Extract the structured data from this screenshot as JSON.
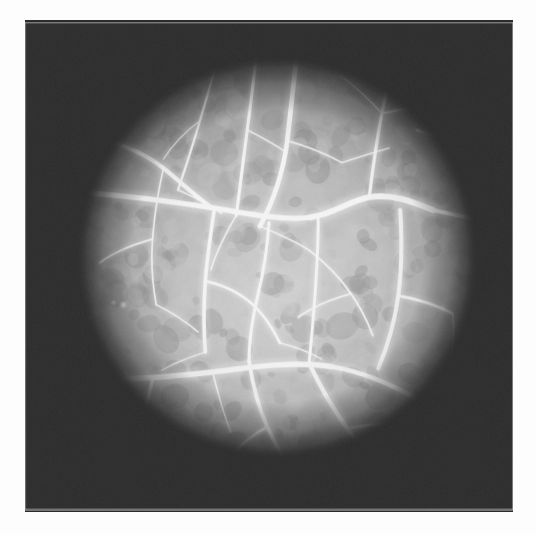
{
  "document": {
    "kind": "photograph",
    "modality": "fluorescein-angiogram",
    "subject": "retinal-fundus",
    "caption": "",
    "page_background": "#fdfdfd"
  },
  "canvas": {
    "width": 536,
    "height": 535
  },
  "photo": {
    "x": 25,
    "y": 20,
    "width": 488,
    "height": 492,
    "border_color": "#d8d8d8",
    "vignette_color": "#2b2b2b",
    "mid_tone": "#8d8d8d",
    "bright_tone": "#e2e2e2",
    "vessel_color": "#f4f4f4"
  },
  "aperture": {
    "label": "circular-fundus-field",
    "cx": 277,
    "cy": 258,
    "r": 222,
    "falloff_inner_pct": 52,
    "falloff_outer_pct": 100
  },
  "chart_data": {
    "type": "scatter",
    "xlabel": "",
    "ylabel": "",
    "categories": [
      "choroidal-background",
      "arterioles",
      "venules",
      "capillary-network"
    ],
    "values": [
      1,
      1,
      1,
      1
    ],
    "grid": false,
    "legend": "none"
  },
  "features": {
    "background_mottle": {
      "name": "choroidal-mottling",
      "blob_count": 420,
      "dark_value": "#6e6e6e",
      "light_value": "#cfcfcf"
    },
    "vessels": [
      {
        "name": "superior-temporal-arcade",
        "width": 5.2,
        "path": "M 300 22 C 296 60, 292 96, 288 130 C 283 168, 272 198, 258 224"
      },
      {
        "name": "superior-nasal-branch",
        "width": 3.4,
        "path": "M 255 25 C 252 58, 248 88, 244 118 C 240 150, 236 182, 232 212"
      },
      {
        "name": "superior-nasal-minor",
        "width": 2.4,
        "path": "M 214 26 C 208 54, 200 82, 192 108 C 184 136, 176 160, 168 184"
      },
      {
        "name": "upper-left-arch",
        "width": 4.6,
        "path": "M 82 128 C 108 134, 132 144, 152 160 C 172 176, 188 192, 206 204"
      },
      {
        "name": "left-horizontal-trunk",
        "width": 5.8,
        "path": "M 58 186 C 108 190, 160 196, 208 204 C 250 211, 286 218, 314 214"
      },
      {
        "name": "central-arch-right",
        "width": 6.4,
        "path": "M 314 214 C 340 210, 356 196, 378 192 C 402 188, 424 196, 448 206"
      },
      {
        "name": "right-upper-diagonal",
        "width": 4.2,
        "path": "M 448 206 C 466 210, 482 214, 500 216"
      },
      {
        "name": "right-superior-branch",
        "width": 3.6,
        "path": "M 378 192 C 382 160, 386 130, 392 100 C 396 76, 402 56, 410 38"
      },
      {
        "name": "right-superior-minor",
        "width": 2.6,
        "path": "M 392 100 C 412 96, 432 92, 452 88 C 468 86, 480 88, 492 92"
      },
      {
        "name": "right-marginal-arc",
        "width": 3.0,
        "path": "M 430 118 C 452 124, 472 134, 490 148"
      },
      {
        "name": "mid-descending-trunk",
        "width": 4.0,
        "path": "M 208 204 C 204 232, 200 258, 198 284 C 196 312, 196 338, 198 362"
      },
      {
        "name": "mid-descending-branch",
        "width": 2.8,
        "path": "M 198 284 C 216 288, 234 296, 248 308 C 262 320, 272 336, 280 352"
      },
      {
        "name": "center-descending-vein",
        "width": 3.4,
        "path": "M 268 220 C 266 248, 262 274, 256 298 C 250 324, 246 348, 246 372"
      },
      {
        "name": "center-right-descending",
        "width": 3.2,
        "path": "M 322 216 C 322 248, 320 278, 318 306 C 316 332, 314 354, 312 374"
      },
      {
        "name": "right-descending-arcade",
        "width": 4.4,
        "path": "M 412 206 C 414 238, 414 270, 410 300 C 406 330, 398 356, 388 380"
      },
      {
        "name": "right-lateral-branch",
        "width": 3.0,
        "path": "M 410 300 C 432 304, 452 310, 470 320"
      },
      {
        "name": "inferior-horizontal-trunk",
        "width": 6.0,
        "path": "M 66 394 C 112 392, 160 390, 206 384 C 252 378, 296 372, 336 378"
      },
      {
        "name": "inferior-right-trunk",
        "width": 5.0,
        "path": "M 336 378 C 372 384, 404 398, 434 416 C 452 428, 466 438, 480 448"
      },
      {
        "name": "inferior-left-descending",
        "width": 3.6,
        "path": "M 140 392 C 134 418, 128 442, 122 464 C 118 480, 114 494, 112 506"
      },
      {
        "name": "lower-left-arc",
        "width": 3.2,
        "path": "M 66 394 C 76 416, 88 436, 104 452 C 120 468, 140 478, 160 484"
      },
      {
        "name": "inferior-mid-descending",
        "width": 4.2,
        "path": "M 246 372 C 250 398, 256 422, 266 444 C 276 466, 288 486, 300 506"
      },
      {
        "name": "inferior-mid-branch",
        "width": 2.8,
        "path": "M 266 444 C 248 454, 232 468, 220 484 C 212 494, 206 502, 202 510"
      },
      {
        "name": "inferior-center-vein",
        "width": 4.8,
        "path": "M 312 374 C 324 400, 338 424, 354 446 C 368 466, 382 484, 396 500"
      },
      {
        "name": "inferior-right-branch",
        "width": 3.0,
        "path": "M 354 446 C 376 442, 398 440, 418 442"
      },
      {
        "name": "capillary-a",
        "width": 1.8,
        "path": "M 152 160 C 146 186, 142 212, 140 238 C 138 264, 140 288, 144 310"
      },
      {
        "name": "capillary-b",
        "width": 1.8,
        "path": "M 140 238 C 118 244, 98 252, 82 264"
      },
      {
        "name": "capillary-c",
        "width": 1.6,
        "path": "M 144 310 C 160 318, 176 328, 190 340"
      },
      {
        "name": "capillary-d",
        "width": 1.6,
        "path": "M 258 224 C 278 232, 296 240, 312 250"
      },
      {
        "name": "capillary-e",
        "width": 1.8,
        "path": "M 312 250 C 330 264, 346 280, 358 298 C 368 312, 376 328, 382 344"
      },
      {
        "name": "capillary-f",
        "width": 1.6,
        "path": "M 358 298 C 336 304, 316 312, 300 324"
      },
      {
        "name": "capillary-g",
        "width": 1.6,
        "path": "M 206 384 C 212 408, 218 430, 226 450"
      },
      {
        "name": "capillary-h",
        "width": 1.5,
        "path": "M 232 212 C 220 232, 210 252, 204 272"
      },
      {
        "name": "capillary-i",
        "width": 1.5,
        "path": "M 288 130 C 310 136, 330 144, 348 154"
      },
      {
        "name": "capillary-j",
        "width": 1.5,
        "path": "M 348 154 C 366 148, 384 142, 400 138"
      },
      {
        "name": "capillary-k",
        "width": 1.4,
        "path": "M 168 184 C 186 192, 202 200, 216 210"
      },
      {
        "name": "capillary-l",
        "width": 1.4,
        "path": "M 452 88 C 458 108, 462 128, 464 148"
      },
      {
        "name": "capillary-m",
        "width": 1.5,
        "path": "M 470 320 C 472 342, 470 362, 464 380"
      },
      {
        "name": "capillary-n",
        "width": 1.4,
        "path": "M 198 362 C 180 368, 164 374, 150 382"
      },
      {
        "name": "capillary-o",
        "width": 1.5,
        "path": "M 280 352 C 296 356, 312 362, 326 370"
      },
      {
        "name": "capillary-p",
        "width": 1.4,
        "path": "M 434 416 C 420 430, 408 444, 400 458"
      },
      {
        "name": "capillary-q",
        "width": 1.4,
        "path": "M 104 452 C 112 466, 120 478, 130 488"
      },
      {
        "name": "capillary-r",
        "width": 1.3,
        "path": "M 392 100 C 378 84, 362 70, 346 58"
      },
      {
        "name": "capillary-s",
        "width": 1.3,
        "path": "M 244 118 C 260 126, 274 134, 286 142"
      },
      {
        "name": "capillary-t",
        "width": 1.3,
        "path": "M 192 108 C 176 120, 162 134, 152 150"
      }
    ],
    "drusen_spots": [
      {
        "name": "bright-spot-lower-left",
        "cx": 124,
        "cy": 472,
        "r": 4.5,
        "value": "#f2f2f2"
      },
      {
        "name": "bright-spot-mid-left",
        "cx": 108,
        "cy": 310,
        "r": 3.0,
        "value": "#e6e6e6"
      },
      {
        "name": "bright-spot-upper-left",
        "cx": 97,
        "cy": 308,
        "r": 2.0,
        "value": "#dedede"
      }
    ]
  }
}
